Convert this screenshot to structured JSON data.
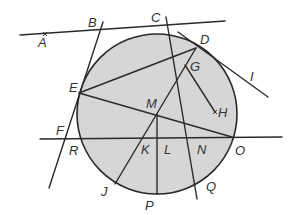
{
  "diagram": {
    "type": "geometry-circle-figure",
    "colors": {
      "circle_fill": "#d6d6d6",
      "stroke": "#2a2a2a",
      "label": "#333333",
      "background": "#ffffff"
    },
    "circle": {
      "center_label": "M",
      "cx": 157,
      "cy": 114,
      "r": 80
    },
    "points": {
      "A": {
        "label": "A",
        "x": 38,
        "y": 47
      },
      "B": {
        "label": "B",
        "x": 88,
        "y": 27
      },
      "C": {
        "label": "C",
        "x": 151,
        "y": 22
      },
      "D": {
        "label": "D",
        "x": 200,
        "y": 44
      },
      "E": {
        "label": "E",
        "x": 69,
        "y": 92
      },
      "F": {
        "label": "F",
        "x": 56,
        "y": 135
      },
      "G": {
        "label": "G",
        "x": 190,
        "y": 71
      },
      "H": {
        "label": "H",
        "x": 218,
        "y": 117
      },
      "I": {
        "label": "I",
        "x": 250,
        "y": 81
      },
      "J": {
        "label": "J",
        "x": 101,
        "y": 196
      },
      "K": {
        "label": "K",
        "x": 141,
        "y": 154
      },
      "L": {
        "label": "L",
        "x": 164,
        "y": 154
      },
      "M": {
        "label": "M",
        "x": 146,
        "y": 108
      },
      "N": {
        "label": "N",
        "x": 197,
        "y": 154
      },
      "O": {
        "label": "O",
        "x": 235,
        "y": 155
      },
      "P": {
        "label": "P",
        "x": 145,
        "y": 210
      },
      "Q": {
        "label": "Q",
        "x": 206,
        "y": 191
      },
      "R": {
        "label": "R",
        "x": 69,
        "y": 155
      }
    },
    "segments": [
      {
        "name": "line-AB",
        "from": "A-end",
        "x1": 20,
        "y1": 35,
        "x2": 225,
        "y2": 21
      },
      {
        "name": "line-BEF",
        "x1": 103,
        "y1": 22,
        "x2": 49,
        "y2": 188
      },
      {
        "name": "line-C-Q",
        "x1": 166,
        "y1": 17,
        "x2": 197,
        "y2": 199
      },
      {
        "name": "tangent-D-I",
        "x1": 178,
        "y1": 32,
        "x2": 268,
        "y2": 97
      },
      {
        "name": "line-FRKLNO",
        "x1": 40,
        "y1": 139,
        "x2": 282,
        "y2": 137
      },
      {
        "name": "chord-ED",
        "x1": 79,
        "y1": 93,
        "x2": 196,
        "y2": 48
      },
      {
        "name": "chord-EO",
        "x1": 79,
        "y1": 93,
        "x2": 232,
        "y2": 137
      },
      {
        "name": "chord-DJ",
        "x1": 196,
        "y1": 48,
        "x2": 115,
        "y2": 184
      },
      {
        "name": "segment-GH",
        "x1": 185,
        "y1": 65,
        "x2": 215,
        "y2": 112
      },
      {
        "name": "segment-MP",
        "x1": 157,
        "y1": 114,
        "x2": 157,
        "y2": 194
      }
    ],
    "markers": [
      {
        "name": "point-marker-A",
        "x": 45,
        "y": 34
      },
      {
        "name": "point-marker-H",
        "x": 215,
        "y": 112
      }
    ]
  }
}
